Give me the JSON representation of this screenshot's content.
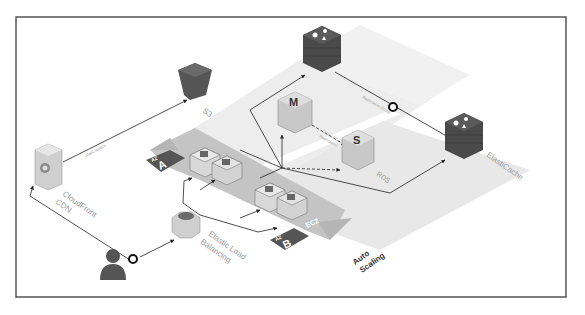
{
  "diagram": {
    "nodes": {
      "s3": {
        "label": "S3"
      },
      "cloudfront": {
        "label_line1": "CloudFront",
        "label_line2": "CDN"
      },
      "elb": {
        "label_line1": "Elastic Load",
        "label_line2": "Balancing"
      },
      "rds": {
        "label": "RDS",
        "master_letter": "M",
        "standby_letter": "S"
      },
      "elasticache": {
        "label": "ElastiCache"
      },
      "ec2": {
        "label": "EC2"
      },
      "user": {
        "label": "User"
      }
    },
    "zones": {
      "az_a": {
        "prefix": "AZ",
        "letter": "A"
      },
      "az_b": {
        "prefix": "AZ",
        "letter": "B"
      }
    },
    "auto_scaling": {
      "line1": "Auto",
      "line2": "Scaling"
    },
    "edges": {
      "static_assets": "Static assets",
      "replication_group": "Replication Group",
      "cross_az_line1": "Cross-AZ",
      "cross_az_line2": "Replication"
    },
    "colors": {
      "dark_block": "#4a4a4a",
      "light_block": "#d6d6d6",
      "lane": "#ececec",
      "arrow": "#8c8c8c",
      "frame": "#555555"
    }
  }
}
